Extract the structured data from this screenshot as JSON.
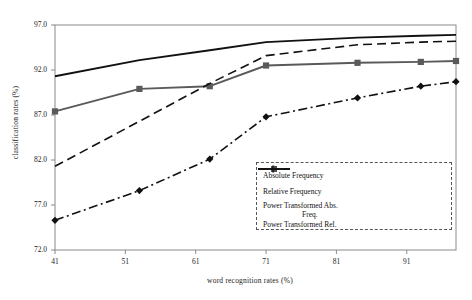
{
  "chart_data": {
    "type": "line",
    "title": "",
    "xlabel": "word recognition rates (%)",
    "ylabel": "classification rates (%)",
    "xlim": [
      41,
      98
    ],
    "ylim": [
      72.0,
      97.0
    ],
    "xticks": [
      "41",
      "51",
      "61",
      "71",
      "81",
      "91"
    ],
    "yticks": [
      "72.0",
      "77.0",
      "82.0",
      "87.0",
      "92.0",
      "97.0"
    ],
    "grid": false,
    "legend_position": "lower right",
    "series": [
      {
        "name": "Absolute Frequency",
        "style": "dash-dot",
        "marker": "diamond",
        "color": "#111111",
        "x": [
          41,
          53,
          63,
          71,
          84,
          93,
          98
        ],
        "y": [
          75.3,
          78.6,
          82.1,
          86.8,
          88.9,
          90.2,
          90.7
        ]
      },
      {
        "name": "Relative Frequency",
        "style": "solid",
        "marker": "square",
        "color": "#5a5a5a",
        "x": [
          41,
          53,
          63,
          71,
          84,
          93,
          98
        ],
        "y": [
          87.4,
          89.9,
          90.2,
          92.5,
          92.8,
          92.9,
          93.0
        ]
      },
      {
        "name": "Power Transformed Abs. Freq.",
        "style": "dashed",
        "marker": "none",
        "color": "#111111",
        "x": [
          41,
          53,
          63,
          71,
          84,
          93,
          98
        ],
        "y": [
          81.3,
          86.3,
          90.5,
          93.6,
          94.8,
          95.1,
          95.2
        ]
      },
      {
        "name": "Power Transformed Rel.",
        "style": "solid",
        "marker": "none",
        "color": "#111111",
        "x": [
          41,
          53,
          63,
          71,
          84,
          93,
          98
        ],
        "y": [
          91.3,
          93.1,
          94.2,
          95.1,
          95.6,
          95.8,
          95.9
        ]
      }
    ]
  },
  "legend": {
    "items": [
      {
        "label": "Absolute Frequency",
        "key": "dash-dot-diamond"
      },
      {
        "label": "Relative Frequency",
        "key": "solid-square"
      },
      {
        "label": "Power Transformed Abs.",
        "key": "dashed"
      },
      {
        "label": "Freq.",
        "key": "continuation"
      },
      {
        "label": "Power Transformed Rel.",
        "key": "solid"
      }
    ]
  }
}
